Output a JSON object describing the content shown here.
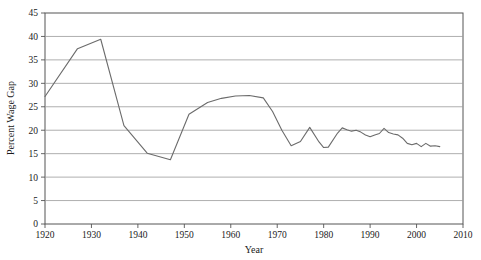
{
  "chart_data": {
    "type": "line",
    "title": "",
    "xlabel": "Year",
    "ylabel": "Percent Wage Gap",
    "xlim": [
      1920,
      2010
    ],
    "ylim": [
      0,
      45
    ],
    "xticks": [
      1920,
      1930,
      1940,
      1950,
      1960,
      1970,
      1980,
      1990,
      2000,
      2010
    ],
    "yticks": [
      0,
      5,
      10,
      15,
      20,
      25,
      30,
      35,
      40,
      45
    ],
    "grid": "horizontal",
    "legend": "none",
    "line_color": "#6b6b6b",
    "series": [
      {
        "name": "Percent Wage Gap",
        "x": [
          1920,
          1927,
          1932,
          1937,
          1942,
          1947,
          1951,
          1955,
          1958,
          1961,
          1964,
          1967,
          1969,
          1971,
          1973,
          1975,
          1977,
          1979,
          1980,
          1981,
          1983,
          1984,
          1985,
          1986,
          1987,
          1988,
          1989,
          1990,
          1991,
          1992,
          1993,
          1994,
          1995,
          1996,
          1997,
          1998,
          1999,
          2000,
          2001,
          2002,
          2003,
          2004,
          2005
        ],
        "values": [
          27.2,
          37.4,
          39.4,
          21.0,
          15.1,
          13.7,
          23.4,
          25.9,
          26.8,
          27.3,
          27.4,
          26.9,
          24.0,
          20.0,
          16.7,
          17.6,
          20.6,
          17.5,
          16.3,
          16.4,
          19.4,
          20.5,
          20.1,
          19.8,
          20.0,
          19.6,
          19.0,
          18.6,
          19.0,
          19.3,
          20.4,
          19.5,
          19.2,
          19.0,
          18.3,
          17.2,
          16.9,
          17.2,
          16.5,
          17.2,
          16.6,
          16.7,
          16.5
        ]
      }
    ]
  }
}
